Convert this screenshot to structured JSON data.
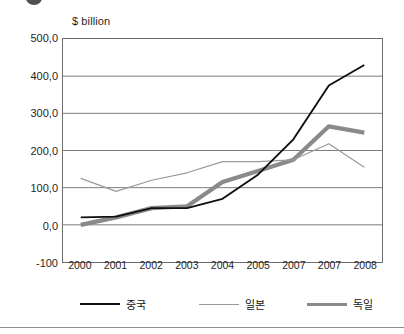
{
  "figure": {
    "unit_label": "$ billion",
    "truncated_title_glyph": true
  },
  "chart_data": {
    "type": "line",
    "title": "",
    "xlabel": "",
    "ylabel": "$ billion",
    "ylim": [
      -100,
      500
    ],
    "yticks": [
      -100,
      0,
      100,
      200,
      300,
      400,
      500
    ],
    "ytick_labels": [
      "-100",
      "0,0",
      "100,0",
      "200,0",
      "300,0",
      "400,0",
      "500,0"
    ],
    "categories": [
      "2000",
      "2001",
      "2002",
      "2003",
      "2004",
      "2005",
      "2007",
      "2007",
      "2008"
    ],
    "grid": true,
    "grid_axis": "y",
    "legend_position": "bottom",
    "series": [
      {
        "name": "중국",
        "color": "#0f0f0f",
        "width": 1.9,
        "values": [
          20,
          22,
          45,
          45,
          70,
          135,
          230,
          375,
          430
        ]
      },
      {
        "name": "일본",
        "color": "#9a9a9a",
        "width": 1.2,
        "values": [
          125,
          90,
          120,
          140,
          170,
          170,
          175,
          218,
          155
        ]
      },
      {
        "name": "독일",
        "color": "#8a8a8a",
        "width": 4.2,
        "values": [
          0,
          20,
          45,
          50,
          115,
          145,
          175,
          265,
          248
        ]
      }
    ]
  }
}
